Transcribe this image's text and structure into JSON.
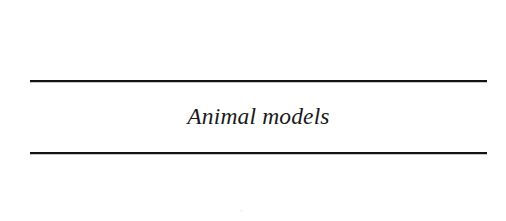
{
  "page": {
    "background_color": "#ffffff",
    "width": 506,
    "height": 221
  },
  "heading": {
    "text": "Animal models",
    "style": "italic-serif",
    "color": "#1a1a1a",
    "alignment": "center"
  },
  "rules": {
    "color": "#141414",
    "top_label": "",
    "bottom_label": ""
  },
  "artifacts": {
    "speck_label": ""
  }
}
